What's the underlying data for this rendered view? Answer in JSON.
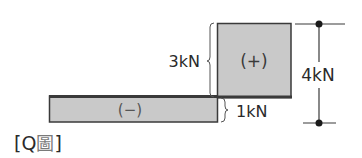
{
  "diagram": {
    "type": "shear-force-diagram",
    "colors": {
      "fill": "#c9c9c9",
      "stroke": "#3a3a3a",
      "text": "#2a2a2a",
      "caption_cjk": "#7a7a7a"
    },
    "regions": [
      {
        "id": "positive",
        "sign_label": "(+)",
        "value_label": "3kN"
      },
      {
        "id": "negative",
        "sign_label": "(−)",
        "value_label": "1kN"
      }
    ],
    "total_dimension": {
      "label": "4kN"
    },
    "caption": {
      "open": "[",
      "letter": "Q",
      "cjk": "圖",
      "close": "]"
    }
  }
}
